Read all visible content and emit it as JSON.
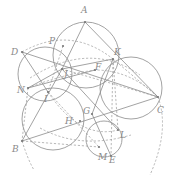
{
  "diagram": {
    "type": "geometry-construction",
    "points": [
      {
        "id": "A",
        "x": 85,
        "y": 22,
        "lx": 81,
        "ly": 13
      },
      {
        "id": "P",
        "x": 63,
        "y": 46,
        "lx": 49,
        "ly": 44
      },
      {
        "id": "D",
        "x": 22,
        "y": 52,
        "lx": 11,
        "ly": 55
      },
      {
        "id": "K",
        "x": 113,
        "y": 59,
        "lx": 114,
        "ly": 55
      },
      {
        "id": "J",
        "x": 62,
        "y": 69,
        "lx": 64,
        "ly": 77
      },
      {
        "id": "F",
        "x": 95,
        "y": 70,
        "lx": 95,
        "ly": 70
      },
      {
        "id": "N",
        "x": 28,
        "y": 88,
        "lx": 17,
        "ly": 93
      },
      {
        "id": "I",
        "x": 48,
        "y": 92,
        "lx": 44,
        "ly": 102
      },
      {
        "id": "C",
        "x": 158,
        "y": 97,
        "lx": 157,
        "ly": 113
      },
      {
        "id": "G",
        "x": 92,
        "y": 114,
        "lx": 83,
        "ly": 114
      },
      {
        "id": "H",
        "x": 80,
        "y": 121,
        "lx": 65,
        "ly": 124
      },
      {
        "id": "L",
        "x": 118,
        "y": 130,
        "lx": 120,
        "ly": 138
      },
      {
        "id": "B",
        "x": 22,
        "y": 141,
        "lx": 12,
        "ly": 152
      },
      {
        "id": "M",
        "x": 99,
        "y": 147,
        "lx": 98,
        "ly": 160
      },
      {
        "id": "E",
        "x": 111,
        "y": 156,
        "lx": 109,
        "ly": 163
      }
    ],
    "circles": [
      {
        "name": "circle-APK",
        "cx": 86,
        "cy": 55,
        "r": 33,
        "style": "solid"
      },
      {
        "name": "circle-DJN",
        "cx": 45,
        "cy": 74,
        "r": 27,
        "style": "solid"
      },
      {
        "name": "circle-BIH",
        "cx": 53,
        "cy": 119,
        "r": 31,
        "style": "solid"
      },
      {
        "name": "circle-KCL",
        "cx": 131,
        "cy": 88,
        "r": 31,
        "style": "solid"
      },
      {
        "name": "circle-GME",
        "cx": 104,
        "cy": 139,
        "r": 18,
        "style": "solid"
      }
    ],
    "segments": [
      {
        "a": "A",
        "b": "J",
        "style": "solid"
      },
      {
        "a": "A",
        "b": "C",
        "style": "solid"
      },
      {
        "a": "D",
        "b": "C",
        "style": "solid"
      },
      {
        "a": "D",
        "b": "I",
        "style": "solid"
      },
      {
        "a": "J",
        "b": "K",
        "style": "solid"
      },
      {
        "a": "K",
        "b": "G",
        "style": "solid"
      },
      {
        "a": "B",
        "b": "C",
        "style": "solid"
      },
      {
        "a": "B",
        "b": "J",
        "style": "solid"
      },
      {
        "a": "J",
        "b": "L",
        "style": "solid"
      },
      {
        "a": "G",
        "b": "E",
        "style": "solid"
      },
      {
        "a": "N",
        "b": "J",
        "style": "solid"
      },
      {
        "a": "N",
        "b": "F",
        "style": "solid"
      }
    ],
    "dashed_segments": [
      {
        "a": "K",
        "b": "E"
      },
      {
        "a": "K",
        "b": "L"
      },
      {
        "a": "K",
        "b": "C"
      },
      {
        "a": "P",
        "b": "I"
      },
      {
        "a": "N",
        "b": "B"
      },
      {
        "a": "I",
        "b": "M"
      },
      {
        "a": "B",
        "b": "M"
      },
      {
        "a": "J",
        "b": "C"
      }
    ]
  }
}
